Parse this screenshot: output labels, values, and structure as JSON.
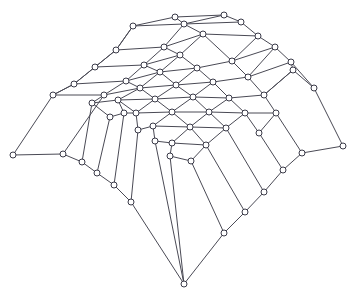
{
  "figure": {
    "background_color": "#ffffff",
    "edge_color": "#4a4a55",
    "node_stroke_color": "#3a3a48",
    "node_fill_color": "#ffffff",
    "accent_teal": "#6f9aa6",
    "accent_magenta": "#8f7f93",
    "accent_green": "#4f9e58",
    "width": 357,
    "height": 299
  },
  "chart_data": {
    "type": "scatter",
    "xlabel": "",
    "ylabel": "",
    "xlim": [
      0,
      357
    ],
    "ylim": [
      0,
      299
    ],
    "grid": false,
    "legend": "none",
    "node_radius": 3.0,
    "node_count": 63,
    "edge_count": 110,
    "nodes": [
      {
        "id": 0,
        "x": 175,
        "y": 17,
        "color": "#3a3a48"
      },
      {
        "id": 1,
        "x": 224,
        "y": 15,
        "color": "#3a3a48"
      },
      {
        "id": 2,
        "x": 133,
        "y": 26,
        "color": "#3a3a48"
      },
      {
        "id": 3,
        "x": 184,
        "y": 24,
        "color": "#3a3a48"
      },
      {
        "id": 4,
        "x": 241,
        "y": 22,
        "color": "#3a3a48"
      },
      {
        "id": 5,
        "x": 116,
        "y": 50,
        "color": "#3a3a48"
      },
      {
        "id": 6,
        "x": 164,
        "y": 47,
        "color": "#3a3a48"
      },
      {
        "id": 7,
        "x": 203,
        "y": 34,
        "color": "#3a3a48"
      },
      {
        "id": 8,
        "x": 258,
        "y": 36,
        "color": "#3a3a48"
      },
      {
        "id": 9,
        "x": 95,
        "y": 67,
        "color": "#3a3a48"
      },
      {
        "id": 10,
        "x": 144,
        "y": 65,
        "color": "#3a3a48"
      },
      {
        "id": 11,
        "x": 180,
        "y": 55,
        "color": "#3a3a48"
      },
      {
        "id": 12,
        "x": 232,
        "y": 61,
        "color": "#3a3a48"
      },
      {
        "id": 13,
        "x": 275,
        "y": 47,
        "color": "#3a3a48"
      },
      {
        "id": 14,
        "x": 74,
        "y": 84,
        "color": "#3a3a48"
      },
      {
        "id": 15,
        "x": 126,
        "y": 81,
        "color": "#3a3a48"
      },
      {
        "id": 16,
        "x": 160,
        "y": 72,
        "color": "#3a3a48"
      },
      {
        "id": 17,
        "x": 197,
        "y": 68,
        "color": "#3a3a48"
      },
      {
        "id": 18,
        "x": 248,
        "y": 77,
        "color": "#3a3a48"
      },
      {
        "id": 19,
        "x": 291,
        "y": 62,
        "color": "#3a3a48"
      },
      {
        "id": 20,
        "x": 53,
        "y": 95,
        "color": "#3a3a48"
      },
      {
        "id": 21,
        "x": 104,
        "y": 95,
        "color": "#3a3a48"
      },
      {
        "id": 22,
        "x": 140,
        "y": 88,
        "color": "#3a3a48"
      },
      {
        "id": 23,
        "x": 176,
        "y": 85,
        "color": "#3a3a48"
      },
      {
        "id": 24,
        "x": 213,
        "y": 82,
        "color": "#3a3a48"
      },
      {
        "id": 25,
        "x": 264,
        "y": 95,
        "color": "#3a3a48"
      },
      {
        "id": 26,
        "x": 293,
        "y": 70,
        "color": "#3a3a48"
      },
      {
        "id": 27,
        "x": 118,
        "y": 100,
        "color": "#3a3a48"
      },
      {
        "id": 28,
        "x": 155,
        "y": 99,
        "color": "#3a3a48"
      },
      {
        "id": 29,
        "x": 193,
        "y": 97,
        "color": "#4f9e58"
      },
      {
        "id": 30,
        "x": 229,
        "y": 98,
        "color": "#3a3a48"
      },
      {
        "id": 31,
        "x": 136,
        "y": 113,
        "color": "#3a3a48"
      },
      {
        "id": 32,
        "x": 172,
        "y": 112,
        "color": "#3a3a48"
      },
      {
        "id": 33,
        "x": 209,
        "y": 112,
        "color": "#3a3a48"
      },
      {
        "id": 34,
        "x": 245,
        "y": 113,
        "color": "#3a3a48"
      },
      {
        "id": 35,
        "x": 153,
        "y": 126,
        "color": "#3a3a48"
      },
      {
        "id": 36,
        "x": 190,
        "y": 127,
        "color": "#3a3a48"
      },
      {
        "id": 37,
        "x": 226,
        "y": 128,
        "color": "#3a3a48"
      },
      {
        "id": 38,
        "x": 172,
        "y": 143,
        "color": "#3a3a48"
      },
      {
        "id": 39,
        "x": 13,
        "y": 155,
        "color": "#4f9e58"
      },
      {
        "id": 40,
        "x": 63,
        "y": 154,
        "color": "#3a3a48"
      },
      {
        "id": 41,
        "x": 82,
        "y": 162,
        "color": "#3a3a48"
      },
      {
        "id": 42,
        "x": 97,
        "y": 173,
        "color": "#4f9e58"
      },
      {
        "id": 43,
        "x": 114,
        "y": 185,
        "color": "#3a3a48"
      },
      {
        "id": 44,
        "x": 131,
        "y": 202,
        "color": "#8a5a5a"
      },
      {
        "id": 45,
        "x": 302,
        "y": 153,
        "color": "#3a3a48"
      },
      {
        "id": 46,
        "x": 343,
        "y": 146,
        "color": "#4f9e58"
      },
      {
        "id": 47,
        "x": 283,
        "y": 170,
        "color": "#3a3a48"
      },
      {
        "id": 48,
        "x": 264,
        "y": 192,
        "color": "#3a3a48"
      },
      {
        "id": 49,
        "x": 245,
        "y": 212,
        "color": "#3a3a48"
      },
      {
        "id": 50,
        "x": 224,
        "y": 233,
        "color": "#3a3a48"
      },
      {
        "id": 51,
        "x": 184,
        "y": 284,
        "color": "#3a3a48"
      },
      {
        "id": 52,
        "x": 110,
        "y": 117,
        "color": "#3a3a48"
      },
      {
        "id": 53,
        "x": 92,
        "y": 103,
        "color": "#3a3a48"
      },
      {
        "id": 54,
        "x": 314,
        "y": 88,
        "color": "#3a3a48"
      },
      {
        "id": 55,
        "x": 276,
        "y": 113,
        "color": "#3a3a48"
      },
      {
        "id": 56,
        "x": 259,
        "y": 133,
        "color": "#3a3a48"
      },
      {
        "id": 57,
        "x": 206,
        "y": 145,
        "color": "#3a3a48"
      },
      {
        "id": 58,
        "x": 191,
        "y": 161,
        "color": "#3a3a48"
      },
      {
        "id": 59,
        "x": 170,
        "y": 156,
        "color": "#3a3a48"
      },
      {
        "id": 60,
        "x": 155,
        "y": 141,
        "color": "#3a3a48"
      },
      {
        "id": 61,
        "x": 138,
        "y": 130,
        "color": "#3a3a48"
      },
      {
        "id": 62,
        "x": 124,
        "y": 113,
        "color": "#3a3a48"
      }
    ],
    "edges": [
      {
        "a": 0,
        "b": 1,
        "color": "#4a4a55"
      },
      {
        "a": 2,
        "b": 0,
        "color": "#4a4a55"
      },
      {
        "a": 2,
        "b": 3,
        "color": "#4a4a55"
      },
      {
        "a": 3,
        "b": 1,
        "color": "#4a4a55"
      },
      {
        "a": 1,
        "b": 4,
        "color": "#4a4a55"
      },
      {
        "a": 3,
        "b": 4,
        "color": "#4a4a55"
      },
      {
        "a": 0,
        "b": 3,
        "color": "#4a4a55"
      },
      {
        "a": 2,
        "b": 5,
        "color": "#4a4a55"
      },
      {
        "a": 5,
        "b": 6,
        "color": "#4a4a55"
      },
      {
        "a": 3,
        "b": 6,
        "color": "#4a4a55"
      },
      {
        "a": 3,
        "b": 7,
        "color": "#4a4a55"
      },
      {
        "a": 6,
        "b": 7,
        "color": "#4a4a55"
      },
      {
        "a": 4,
        "b": 8,
        "color": "#4a4a55"
      },
      {
        "a": 7,
        "b": 8,
        "color": "#4a4a55"
      },
      {
        "a": 5,
        "b": 9,
        "color": "#4a4a55"
      },
      {
        "a": 9,
        "b": 10,
        "color": "#4a4a55"
      },
      {
        "a": 6,
        "b": 10,
        "color": "#4a4a55"
      },
      {
        "a": 6,
        "b": 11,
        "color": "#4a4a55"
      },
      {
        "a": 10,
        "b": 11,
        "color": "#4a4a55"
      },
      {
        "a": 7,
        "b": 11,
        "color": "#4a4a55"
      },
      {
        "a": 7,
        "b": 12,
        "color": "#4a4a55"
      },
      {
        "a": 8,
        "b": 13,
        "color": "#4a4a55"
      },
      {
        "a": 12,
        "b": 13,
        "color": "#4a4a55"
      },
      {
        "a": 8,
        "b": 12,
        "color": "#4a4a55"
      },
      {
        "a": 9,
        "b": 14,
        "color": "#4a4a55"
      },
      {
        "a": 14,
        "b": 15,
        "color": "#4a4a55"
      },
      {
        "a": 10,
        "b": 15,
        "color": "#4a4a55"
      },
      {
        "a": 10,
        "b": 16,
        "color": "#4a4a55"
      },
      {
        "a": 15,
        "b": 16,
        "color": "#4a4a55"
      },
      {
        "a": 11,
        "b": 16,
        "color": "#4a4a55"
      },
      {
        "a": 11,
        "b": 17,
        "color": "#4a4a55"
      },
      {
        "a": 16,
        "b": 17,
        "color": "#4a4a55"
      },
      {
        "a": 12,
        "b": 17,
        "color": "#4a4a55"
      },
      {
        "a": 12,
        "b": 18,
        "color": "#4a4a55"
      },
      {
        "a": 13,
        "b": 19,
        "color": "#4a4a55"
      },
      {
        "a": 18,
        "b": 19,
        "color": "#4a4a55"
      },
      {
        "a": 13,
        "b": 18,
        "color": "#4a4a55"
      },
      {
        "a": 14,
        "b": 20,
        "color": "#6f9aa6"
      },
      {
        "a": 20,
        "b": 21,
        "color": "#6f9aa6"
      },
      {
        "a": 15,
        "b": 21,
        "color": "#4a4a55"
      },
      {
        "a": 15,
        "b": 22,
        "color": "#4a4a55"
      },
      {
        "a": 21,
        "b": 22,
        "color": "#4a4a55"
      },
      {
        "a": 16,
        "b": 22,
        "color": "#4a4a55"
      },
      {
        "a": 16,
        "b": 23,
        "color": "#4a4a55"
      },
      {
        "a": 22,
        "b": 23,
        "color": "#4a4a55"
      },
      {
        "a": 17,
        "b": 23,
        "color": "#4a4a55"
      },
      {
        "a": 17,
        "b": 24,
        "color": "#4a4a55"
      },
      {
        "a": 23,
        "b": 24,
        "color": "#4a4a55"
      },
      {
        "a": 18,
        "b": 24,
        "color": "#4a4a55"
      },
      {
        "a": 18,
        "b": 25,
        "color": "#4a4a55"
      },
      {
        "a": 19,
        "b": 26,
        "color": "#4a4a55"
      },
      {
        "a": 25,
        "b": 26,
        "color": "#4a4a55"
      },
      {
        "a": 19,
        "b": 54,
        "color": "#4a4a55"
      },
      {
        "a": 26,
        "b": 54,
        "color": "#4a4a55"
      },
      {
        "a": 21,
        "b": 53,
        "color": "#4a4a55"
      },
      {
        "a": 53,
        "b": 27,
        "color": "#4a4a55"
      },
      {
        "a": 22,
        "b": 27,
        "color": "#4a4a55"
      },
      {
        "a": 22,
        "b": 28,
        "color": "#4a4a55"
      },
      {
        "a": 27,
        "b": 28,
        "color": "#4a4a55"
      },
      {
        "a": 23,
        "b": 28,
        "color": "#4a4a55"
      },
      {
        "a": 23,
        "b": 29,
        "color": "#4a4a55"
      },
      {
        "a": 28,
        "b": 29,
        "color": "#4a4a55"
      },
      {
        "a": 24,
        "b": 29,
        "color": "#4a4a55"
      },
      {
        "a": 24,
        "b": 30,
        "color": "#4a4a55"
      },
      {
        "a": 29,
        "b": 30,
        "color": "#4a4a55"
      },
      {
        "a": 25,
        "b": 30,
        "color": "#4a4a55"
      },
      {
        "a": 25,
        "b": 55,
        "color": "#4a4a55"
      },
      {
        "a": 53,
        "b": 52,
        "color": "#4a4a55"
      },
      {
        "a": 52,
        "b": 62,
        "color": "#4a4a55"
      },
      {
        "a": 27,
        "b": 62,
        "color": "#4a4a55"
      },
      {
        "a": 27,
        "b": 31,
        "color": "#4a4a55"
      },
      {
        "a": 62,
        "b": 31,
        "color": "#4a4a55"
      },
      {
        "a": 28,
        "b": 31,
        "color": "#4a4a55"
      },
      {
        "a": 28,
        "b": 32,
        "color": "#4a4a55"
      },
      {
        "a": 31,
        "b": 32,
        "color": "#4a4a55"
      },
      {
        "a": 29,
        "b": 32,
        "color": "#4a4a55"
      },
      {
        "a": 29,
        "b": 33,
        "color": "#4a4a55"
      },
      {
        "a": 32,
        "b": 33,
        "color": "#4a4a55"
      },
      {
        "a": 30,
        "b": 33,
        "color": "#4a4a55"
      },
      {
        "a": 30,
        "b": 34,
        "color": "#4a4a55"
      },
      {
        "a": 33,
        "b": 34,
        "color": "#4a4a55"
      },
      {
        "a": 55,
        "b": 34,
        "color": "#4a4a55"
      },
      {
        "a": 55,
        "b": 56,
        "color": "#4a4a55"
      },
      {
        "a": 34,
        "b": 56,
        "color": "#4a4a55"
      },
      {
        "a": 31,
        "b": 61,
        "color": "#4a4a55"
      },
      {
        "a": 61,
        "b": 35,
        "color": "#4a4a55"
      },
      {
        "a": 32,
        "b": 35,
        "color": "#4a4a55"
      },
      {
        "a": 32,
        "b": 36,
        "color": "#4a4a55"
      },
      {
        "a": 35,
        "b": 36,
        "color": "#4a4a55"
      },
      {
        "a": 33,
        "b": 36,
        "color": "#4a4a55"
      },
      {
        "a": 33,
        "b": 37,
        "color": "#4a4a55"
      },
      {
        "a": 36,
        "b": 37,
        "color": "#4a4a55"
      },
      {
        "a": 34,
        "b": 37,
        "color": "#4a4a55"
      },
      {
        "a": 35,
        "b": 60,
        "color": "#4a4a55"
      },
      {
        "a": 60,
        "b": 38,
        "color": "#4a4a55"
      },
      {
        "a": 36,
        "b": 38,
        "color": "#4a4a55"
      },
      {
        "a": 36,
        "b": 57,
        "color": "#4a4a55"
      },
      {
        "a": 38,
        "b": 57,
        "color": "#4a4a55"
      },
      {
        "a": 37,
        "b": 57,
        "color": "#4a4a55"
      },
      {
        "a": 38,
        "b": 59,
        "color": "#4a4a55"
      },
      {
        "a": 59,
        "b": 58,
        "color": "#4a4a55"
      },
      {
        "a": 57,
        "b": 58,
        "color": "#4a4a55"
      },
      {
        "a": 20,
        "b": 39,
        "color": "#4a4a55"
      },
      {
        "a": 39,
        "b": 40,
        "color": "#6f9aa6"
      },
      {
        "a": 21,
        "b": 40,
        "color": "#4a4a55"
      },
      {
        "a": 40,
        "b": 41,
        "color": "#4a4a55"
      },
      {
        "a": 53,
        "b": 41,
        "color": "#4a4a55"
      },
      {
        "a": 41,
        "b": 42,
        "color": "#4a4a55"
      },
      {
        "a": 52,
        "b": 42,
        "color": "#4a4a55"
      },
      {
        "a": 42,
        "b": 43,
        "color": "#4a4a55"
      },
      {
        "a": 62,
        "b": 43,
        "color": "#4a4a55"
      },
      {
        "a": 43,
        "b": 44,
        "color": "#4a4a55"
      },
      {
        "a": 61,
        "b": 44,
        "color": "#4a4a55"
      },
      {
        "a": 44,
        "b": 51,
        "color": "#4a4a55"
      },
      {
        "a": 60,
        "b": 51,
        "color": "#4a4a55"
      },
      {
        "a": 59,
        "b": 51,
        "color": "#4a4a55"
      },
      {
        "a": 58,
        "b": 50,
        "color": "#4a4a55"
      },
      {
        "a": 51,
        "b": 50,
        "color": "#4a4a55"
      },
      {
        "a": 57,
        "b": 49,
        "color": "#4a4a55"
      },
      {
        "a": 50,
        "b": 49,
        "color": "#4a4a55"
      },
      {
        "a": 37,
        "b": 48,
        "color": "#4a4a55"
      },
      {
        "a": 49,
        "b": 48,
        "color": "#4a4a55"
      },
      {
        "a": 56,
        "b": 47,
        "color": "#4a4a55"
      },
      {
        "a": 48,
        "b": 47,
        "color": "#4a4a55"
      },
      {
        "a": 55,
        "b": 45,
        "color": "#4a4a55"
      },
      {
        "a": 47,
        "b": 45,
        "color": "#4a4a55"
      },
      {
        "a": 45,
        "b": 46,
        "color": "#8f7f93"
      },
      {
        "a": 54,
        "b": 46,
        "color": "#4a4a55"
      },
      {
        "a": 26,
        "b": 25,
        "color": "#4a4a55"
      },
      {
        "a": 5,
        "b": 2,
        "color": "#4a4a55"
      },
      {
        "a": 9,
        "b": 5,
        "color": "#4a4a55"
      },
      {
        "a": 14,
        "b": 9,
        "color": "#4a4a55"
      },
      {
        "a": 20,
        "b": 14,
        "color": "#4a4a55"
      }
    ]
  }
}
